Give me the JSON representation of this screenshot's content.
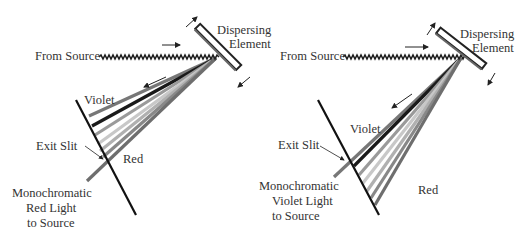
{
  "panels": [
    {
      "id": "red",
      "labels": {
        "from_source": "From Source",
        "dispersing_line1": "Dispersing",
        "dispersing_line2": "Element",
        "violet": "Violet",
        "red": "Red",
        "exit_slit": "Exit Slit",
        "mono_line1": "Monochromatic",
        "mono_line2": "Red Light",
        "mono_line3": "to Source"
      }
    },
    {
      "id": "violet",
      "labels": {
        "from_source": "From Source",
        "dispersing_line1": "Dispersing",
        "dispersing_line2": "Element",
        "violet": "Violet",
        "red": "Red",
        "exit_slit": "Exit Slit",
        "mono_line1": "Monochromatic",
        "mono_line2": "Violet Light",
        "mono_line3": "to Source"
      }
    }
  ],
  "colors": {
    "text": "#333333",
    "slit": "#111111",
    "element_outline": "#555555",
    "rays": [
      "#777777",
      "#1a1a1a",
      "#9a9a9a",
      "#c8c8c8",
      "#b0b0b0",
      "#888888",
      "#6e6e6e"
    ]
  }
}
